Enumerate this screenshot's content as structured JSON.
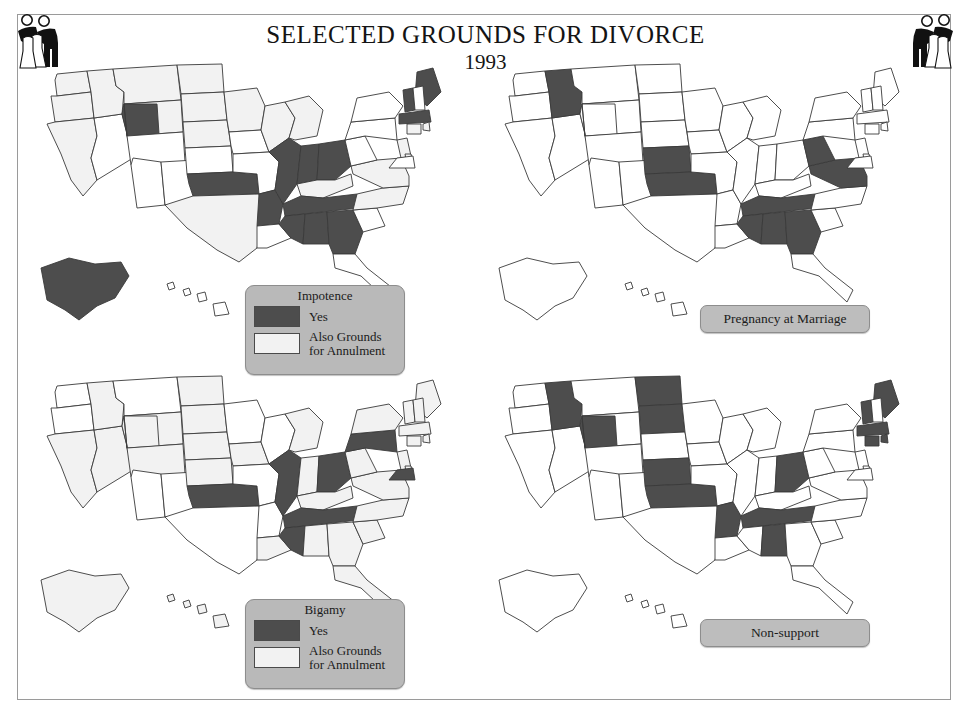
{
  "header": {
    "title": "SELECTED GROUNDS FOR DIVORCE",
    "year": "1993",
    "corner_icon_left": "wedding-couple-icon",
    "corner_icon_right": "wedding-couple-icon"
  },
  "colors": {
    "yes": "#4d4d4d",
    "annulment": "#f2f2f2",
    "no": "#ffffff",
    "outline": "#3a3a3a",
    "legend_panel": "#b9b9b9"
  },
  "legend_common": {
    "yes_label": "Yes",
    "annulment_label_line1": "Also Grounds",
    "annulment_label_line2": "for Annulment"
  },
  "chart_data": {
    "type": "map",
    "title": "SELECTED GROUNDS FOR DIVORCE",
    "subtitle": "1993",
    "legend_position": "inset-bottom-center",
    "categories": [
      "yes",
      "annulment",
      "no"
    ],
    "maps": [
      {
        "id": "impotence",
        "title": "Impotence",
        "has_swatch_legend": true,
        "yes": [
          "AK",
          "UT",
          "OK",
          "AR",
          "IL",
          "IN",
          "OH",
          "TN",
          "MS",
          "AL",
          "GA",
          "ME",
          "VT",
          "MA"
        ],
        "annulment": [
          "WA",
          "OR",
          "ID",
          "MT",
          "WY",
          "ND",
          "SD",
          "NE",
          "CA",
          "TX",
          "MN",
          "WI",
          "MI",
          "KY",
          "VA",
          "NC",
          "NJ",
          "DE",
          "CT",
          "RI"
        ],
        "no": [
          "NV",
          "AZ",
          "NM",
          "CO",
          "KS",
          "MO",
          "IA",
          "LA",
          "FL",
          "SC",
          "WV",
          "PA",
          "NY",
          "NH",
          "MD",
          "HI"
        ]
      },
      {
        "id": "pregnancy-at-marriage",
        "title": "Pregnancy at Marriage",
        "has_swatch_legend": false,
        "yes": [
          "ID",
          "KS",
          "OK",
          "MS",
          "AL",
          "GA",
          "TN",
          "WV",
          "VA"
        ],
        "annulment": [],
        "no": [
          "WA",
          "OR",
          "CA",
          "NV",
          "AZ",
          "UT",
          "MT",
          "WY",
          "CO",
          "NM",
          "ND",
          "SD",
          "NE",
          "TX",
          "MN",
          "IA",
          "MO",
          "AR",
          "LA",
          "WI",
          "IL",
          "MI",
          "IN",
          "OH",
          "KY",
          "FL",
          "SC",
          "NC",
          "PA",
          "NY",
          "NJ",
          "DE",
          "MD",
          "CT",
          "RI",
          "MA",
          "VT",
          "NH",
          "ME",
          "AK",
          "HI"
        ]
      },
      {
        "id": "bigamy",
        "title": "Bigamy",
        "has_swatch_legend": true,
        "yes": [
          "OK",
          "MS",
          "TN",
          "IL",
          "OH",
          "PA",
          "MD"
        ],
        "annulment": [
          "CA",
          "NV",
          "ID",
          "UT",
          "WY",
          "CO",
          "ND",
          "SD",
          "NE",
          "KS",
          "AK",
          "IA",
          "IN",
          "MI",
          "KY",
          "AL",
          "GA",
          "SC",
          "NC",
          "VA",
          "WV",
          "NY",
          "VT",
          "NH",
          "ME",
          "MA",
          "CT",
          "RI",
          "NJ",
          "DE",
          "FL",
          "HI",
          "LA"
        ],
        "no": [
          "WA",
          "OR",
          "MT",
          "MN",
          "WI",
          "MO",
          "AR",
          "TX",
          "NM",
          "AZ"
        ]
      },
      {
        "id": "non-support",
        "title": "Non-support",
        "has_swatch_legend": false,
        "yes": [
          "ID",
          "UT",
          "ND",
          "SD",
          "KS",
          "OK",
          "AR",
          "AL",
          "TN",
          "OH",
          "ME",
          "VT",
          "MA",
          "CT",
          "RI"
        ],
        "annulment": [],
        "no": [
          "WA",
          "OR",
          "CA",
          "NV",
          "AZ",
          "NM",
          "MT",
          "WY",
          "CO",
          "NE",
          "TX",
          "MN",
          "IA",
          "MO",
          "LA",
          "MS",
          "WI",
          "IL",
          "IN",
          "MI",
          "KY",
          "GA",
          "FL",
          "SC",
          "NC",
          "VA",
          "WV",
          "PA",
          "NY",
          "NJ",
          "DE",
          "MD",
          "NH",
          "AK",
          "HI"
        ]
      }
    ]
  }
}
